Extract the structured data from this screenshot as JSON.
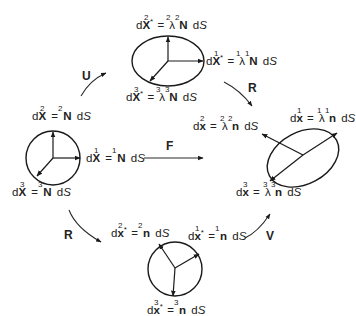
{
  "diagram": {
    "operators": {
      "U": "U",
      "F": "F",
      "R_top": "R",
      "R_bottom": "R",
      "V": "V"
    },
    "nodes": {
      "reference": {
        "shape": "circle",
        "labels": [
          {
            "id": "1",
            "lhs": "dX",
            "sup": "1",
            "rhs_coef": "",
            "rhs_vec": "N",
            "rhs_sup": "1",
            "tail": "dS"
          },
          {
            "id": "2",
            "lhs": "dX",
            "sup": "2",
            "rhs_coef": "",
            "rhs_vec": "N",
            "rhs_sup": "2",
            "tail": "dS"
          },
          {
            "id": "3",
            "lhs": "dX",
            "sup": "3",
            "rhs_coef": "",
            "rhs_vec": "N",
            "rhs_sup": "3",
            "tail": "dS"
          }
        ]
      },
      "stretched_reference": {
        "shape": "ellipse",
        "labels": [
          {
            "id": "1",
            "lhs": "dX*",
            "sup": "1",
            "rhs_coef": "λ",
            "coef_sup": "1",
            "rhs_vec": "N",
            "rhs_sup": "1",
            "tail": "dS"
          },
          {
            "id": "2",
            "lhs": "dX*",
            "sup": "2",
            "rhs_coef": "λ",
            "coef_sup": "2",
            "rhs_vec": "N",
            "rhs_sup": "2",
            "tail": "dS"
          },
          {
            "id": "3",
            "lhs": "dX*",
            "sup": "3",
            "rhs_coef": "λ",
            "coef_sup": "3",
            "rhs_vec": "N",
            "rhs_sup": "3",
            "tail": "dS"
          }
        ]
      },
      "current": {
        "shape": "rotated-ellipse",
        "labels": [
          {
            "id": "1",
            "lhs": "dx",
            "sup": "1",
            "rhs_coef": "λ",
            "coef_sup": "1",
            "rhs_vec": "n",
            "rhs_sup": "1",
            "tail": "dS"
          },
          {
            "id": "2",
            "lhs": "dx",
            "sup": "2",
            "rhs_coef": "λ",
            "coef_sup": "2",
            "rhs_vec": "n",
            "rhs_sup": "2",
            "tail": "dS"
          },
          {
            "id": "3",
            "lhs": "dx",
            "sup": "3",
            "rhs_coef": "λ",
            "coef_sup": "3",
            "rhs_vec": "n",
            "rhs_sup": "3",
            "tail": "dS"
          }
        ]
      },
      "rotated_reference": {
        "shape": "circle",
        "labels": [
          {
            "id": "1",
            "lhs": "dx*",
            "sup": "1",
            "rhs_coef": "",
            "rhs_vec": "n",
            "rhs_sup": "1",
            "tail": "dS"
          },
          {
            "id": "2",
            "lhs": "dx*",
            "sup": "2",
            "rhs_coef": "",
            "rhs_vec": "n",
            "rhs_sup": "2",
            "tail": "dS"
          },
          {
            "id": "3",
            "lhs": "dx*",
            "sup": "3",
            "rhs_coef": "",
            "rhs_vec": "n",
            "rhs_sup": "3",
            "tail": "dS"
          }
        ]
      }
    },
    "edges": [
      {
        "from": "reference",
        "to": "stretched_reference",
        "label": "U"
      },
      {
        "from": "stretched_reference",
        "to": "current",
        "label": "R"
      },
      {
        "from": "reference",
        "to": "current",
        "label": "F"
      },
      {
        "from": "reference",
        "to": "rotated_reference",
        "label": "R"
      },
      {
        "from": "rotated_reference",
        "to": "current",
        "label": "V"
      }
    ],
    "text": {
      "eq": "=",
      "d": "d",
      "X": "X",
      "x": "x",
      "N": "N",
      "n": "n",
      "lambda": "λ",
      "star": "*",
      "dS": "dS",
      "s1": "1",
      "s2": "2",
      "s3": "3"
    }
  }
}
